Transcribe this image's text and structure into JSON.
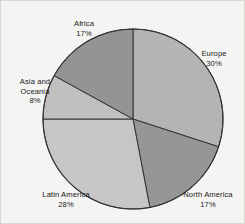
{
  "chart_data": {
    "type": "pie",
    "title": "",
    "subtitle": "",
    "xlabel": "",
    "ylabel": "",
    "legend_position": "none",
    "grid": false,
    "units": "percent",
    "total": 100,
    "start_angle_deg": 0,
    "direction": "clockwise",
    "categories": [
      "Europe",
      "North America",
      "Latin America",
      "Asia and Oceania",
      "Africa"
    ],
    "values": [
      30,
      17,
      28,
      8,
      17
    ],
    "labels": [
      "30%",
      "17%",
      "28%",
      "8%",
      "17%"
    ],
    "colors": [
      "#b4b4b4",
      "#969696",
      "#c6c6c6",
      "#c0c0c0",
      "#949494"
    ],
    "slices": [
      {
        "name": "Europe",
        "value": 30,
        "label": "30%",
        "color": "#b4b4b4",
        "start_deg": 0,
        "end_deg": 108
      },
      {
        "name": "North America",
        "value": 17,
        "label": "17%",
        "color": "#969696",
        "start_deg": 108,
        "end_deg": 169.2
      },
      {
        "name": "Latin America",
        "value": 28,
        "label": "28%",
        "color": "#c6c6c6",
        "start_deg": 169.2,
        "end_deg": 270
      },
      {
        "name": "Asia and Oceania",
        "value": 8,
        "label": "8%",
        "color": "#c0c0c0",
        "start_deg": 270,
        "end_deg": 298.8
      },
      {
        "name": "Africa",
        "value": 17,
        "label": "17%",
        "color": "#949494",
        "start_deg": 298.8,
        "end_deg": 360
      }
    ]
  },
  "figure": {
    "background_color": "#f4f4f2",
    "border_color": "#d8d8d4",
    "outline_color": "#333333",
    "center_x": 132,
    "center_y": 118,
    "radius": 90
  },
  "labels": {
    "europe": {
      "name": "Europe",
      "pct": "30%"
    },
    "north_america": {
      "name": "North America",
      "pct": "17%"
    },
    "latin_america": {
      "name": "Latin America",
      "pct": "28%"
    },
    "asia_oceania_line1": "Asia and",
    "asia_oceania_line2": "Oceania",
    "asia_oceania_pct": "8%",
    "africa": {
      "name": "Africa",
      "pct": "17%"
    }
  }
}
